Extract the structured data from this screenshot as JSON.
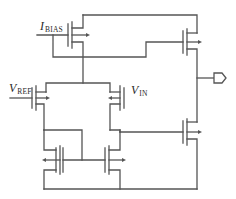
{
  "diagram": {
    "type": "circuit-schematic",
    "stroke_color": "#555555",
    "labels": {
      "ibias": {
        "main": "I",
        "sub": "BIAS"
      },
      "vref": {
        "main": "V",
        "sub": "REF"
      },
      "vin": {
        "main": "V",
        "sub": "IN"
      }
    },
    "components": [
      {
        "id": "M_bias",
        "kind": "pmos-current-source",
        "label": "I_BIAS"
      },
      {
        "id": "M_ref",
        "kind": "pmos-diff-input",
        "label": "V_REF"
      },
      {
        "id": "M_in",
        "kind": "pmos-diff-input",
        "label": "V_IN"
      },
      {
        "id": "M_mirror_left",
        "kind": "nmos-mirror-diode"
      },
      {
        "id": "M_mirror_right",
        "kind": "nmos-mirror"
      },
      {
        "id": "M_out_top",
        "kind": "pmos-output-pullup"
      },
      {
        "id": "M_out_bottom",
        "kind": "nmos-output-pulldown"
      },
      {
        "id": "OUT",
        "kind": "output-port"
      }
    ]
  }
}
